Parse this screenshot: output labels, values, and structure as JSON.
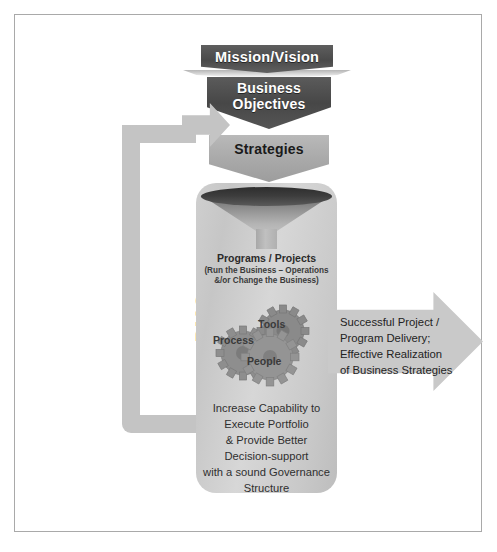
{
  "diagram": {
    "title_flow": [
      {
        "id": "mission",
        "label": "Mission/Vision"
      },
      {
        "id": "objectives",
        "label": "Business\nObjectives"
      },
      {
        "id": "strategies",
        "label": "Strategies"
      }
    ],
    "mission": {
      "label": "Mission/Vision"
    },
    "objectives": {
      "line1": "Business",
      "line2": "Objectives"
    },
    "strategies": {
      "label": "Strategies"
    },
    "loop": {
      "label": "PMO"
    },
    "funnel": {
      "icon": "funnel-icon"
    },
    "programs": {
      "title": "Programs / Projects",
      "sub_line1": "(Run the Business – Operations",
      "sub_line2": "&/or Change the Business)"
    },
    "gears": [
      {
        "id": "process",
        "label": "Process",
        "icon": "gear-icon"
      },
      {
        "id": "tools",
        "label": "Tools",
        "icon": "gear-icon"
      },
      {
        "id": "people",
        "label": "People",
        "icon": "gear-icon"
      }
    ],
    "gear_process": {
      "label": "Process"
    },
    "gear_tools": {
      "label": "Tools"
    },
    "gear_people": {
      "label": "People"
    },
    "capability": {
      "line1": "Increase Capability to",
      "line2": "Execute Portfolio",
      "line3": "& Provide Better",
      "line4": "Decision-support",
      "line5": "with a sound Governance",
      "line6": "Structure"
    },
    "outcome": {
      "line1": "Successful Project /",
      "line2": "Program Delivery;",
      "line3": "Effective Realization",
      "line4": "of Business Strategies"
    },
    "colors": {
      "frame_border": "#a9a9a9",
      "dark_chevron": "#4a4a4a",
      "mid_chevron": "#a8a8a8",
      "tube_fill": "#cfcfcf",
      "loop_fill": "#c4c4c4",
      "arrow_fill": "#c9c9c9",
      "funnel_rim": "#2e2e2e",
      "gear_fill": "#8e8e8e",
      "text_dark": "#232323",
      "text_light": "#ffffff"
    }
  }
}
